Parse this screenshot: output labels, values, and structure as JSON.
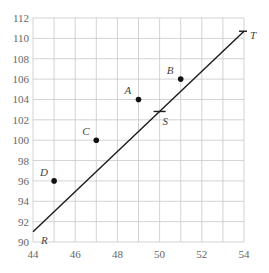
{
  "chart_data": {
    "type": "scatter",
    "title": "",
    "xlabel": "",
    "ylabel": "",
    "xlim": [
      44,
      54
    ],
    "ylim": [
      90,
      112
    ],
    "grid": true,
    "x_ticks": [
      44,
      46,
      48,
      50,
      52,
      54
    ],
    "y_ticks": [
      90,
      92,
      94,
      96,
      98,
      100,
      102,
      104,
      106,
      108,
      110,
      112
    ],
    "x_minor_step": 1,
    "y_minor_step": 2,
    "points": [
      {
        "label": "A",
        "x": 49,
        "y": 104
      },
      {
        "label": "B",
        "x": 51,
        "y": 106
      },
      {
        "label": "C",
        "x": 47,
        "y": 100
      },
      {
        "label": "D",
        "x": 45,
        "y": 96
      }
    ],
    "line": {
      "start": {
        "label": "R",
        "x": 44,
        "y": 91
      },
      "end": {
        "label": "T",
        "x": 54,
        "y": 110.7
      },
      "marker": {
        "label": "S",
        "x": 50,
        "y": 103
      }
    }
  }
}
